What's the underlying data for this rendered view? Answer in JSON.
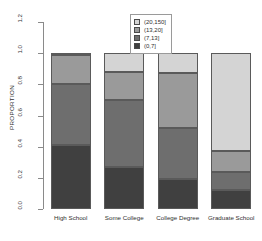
{
  "chart_data": {
    "type": "bar",
    "title": "",
    "subtitle": "",
    "xlabel": "",
    "ylabel": "PROPORTION",
    "stacked": true,
    "grid": false,
    "legend_position": "top-center",
    "ylim": [
      0.0,
      1.2
    ],
    "ytick_labels": [
      "1.2",
      "1.0",
      "0.8",
      "0.6",
      "0.4",
      "0.2",
      "0.0"
    ],
    "ytick_values": [
      1.2,
      1.0,
      0.8,
      0.6,
      0.4,
      0.2,
      0.0
    ],
    "categories": [
      "High School",
      "Some College",
      "College Degree",
      "Graduate School"
    ],
    "series": [
      {
        "name": "(0,7]",
        "color": "#404040",
        "values": [
          0.41,
          0.27,
          0.19,
          0.12
        ]
      },
      {
        "name": "(7,13]",
        "color": "#6e6e6e",
        "values": [
          0.39,
          0.43,
          0.33,
          0.12
        ]
      },
      {
        "name": "(13,20]",
        "color": "#9a9a9a",
        "values": [
          0.19,
          0.18,
          0.35,
          0.13
        ]
      },
      {
        "name": "(20,150]",
        "color": "#d4d4d4",
        "values": [
          0.01,
          0.12,
          0.13,
          0.63
        ]
      }
    ],
    "cumulative_tops": [
      [
        0.41,
        0.8,
        0.99,
        1.0
      ],
      [
        0.27,
        0.7,
        0.88,
        1.0
      ],
      [
        0.19,
        0.52,
        0.87,
        1.0
      ],
      [
        0.12,
        0.24,
        0.37,
        1.0
      ]
    ]
  },
  "legend": {
    "entries": [
      {
        "label": "(20,150]",
        "color": "#d4d4d4"
      },
      {
        "label": "(13,20]",
        "color": "#9a9a9a"
      },
      {
        "label": "(7,13]",
        "color": "#6e6e6e"
      },
      {
        "label": "(0,7]",
        "color": "#404040"
      }
    ]
  },
  "axis": {
    "y_title": "PROPORTION"
  }
}
